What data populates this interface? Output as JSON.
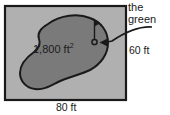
{
  "figure": {
    "labels": {
      "callout_line1": "the",
      "callout_line2": "green",
      "right_side_length": "60 ft",
      "bottom_side_length": "80 ft",
      "area_value": "1,800 ft",
      "area_exponent": "2"
    },
    "colors": {
      "page_background": "#ffffff",
      "rectangle_fill": "#b0b0b0",
      "rectangle_stroke": "#1a1a1a",
      "green_fill": "#7a7a7a",
      "green_stroke": "#1a1a1a",
      "text": "#1a1a1a",
      "arrow": "#1a1a1a"
    },
    "shapes": {
      "rectangle": "outer-rectangle-plot",
      "green": "irregular-green-blob",
      "pin": "golf-flag-pin",
      "hole": "golf-hole-circle",
      "arrow": "callout-arrow-curved"
    }
  }
}
